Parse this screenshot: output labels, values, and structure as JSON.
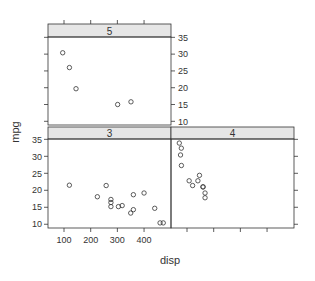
{
  "chart_data": {
    "type": "scatter",
    "title": "",
    "xlabel": "disp",
    "ylabel": "mpg",
    "conditioning_variable": "gear",
    "layout": "2 columns x 2 rows, panels 3 and 4 on bottom row, panel 5 top-left",
    "xlim": [
      40,
      501
    ],
    "ylim": [
      8.9,
      35.1
    ],
    "x_ticks": [
      100,
      200,
      300,
      400
    ],
    "y_ticks": [
      10,
      15,
      20,
      25,
      30,
      35
    ],
    "grid": false,
    "legend": null,
    "marker": "open-circle",
    "colors": {
      "strip_fill": "#e6e6e6",
      "axis": "#333333",
      "points": "#333333"
    },
    "panels": [
      {
        "strip_label": "3",
        "points": [
          {
            "x": 258,
            "y": 21.4
          },
          {
            "x": 360,
            "y": 18.7
          },
          {
            "x": 225,
            "y": 18.1
          },
          {
            "x": 360,
            "y": 14.3
          },
          {
            "x": 275.8,
            "y": 16.4
          },
          {
            "x": 275.8,
            "y": 17.3
          },
          {
            "x": 275.8,
            "y": 15.2
          },
          {
            "x": 472,
            "y": 10.4
          },
          {
            "x": 460,
            "y": 10.4
          },
          {
            "x": 440,
            "y": 14.7
          },
          {
            "x": 120.1,
            "y": 21.5
          },
          {
            "x": 318,
            "y": 15.5
          },
          {
            "x": 304,
            "y": 15.2
          },
          {
            "x": 350,
            "y": 13.3
          },
          {
            "x": 400,
            "y": 19.2
          }
        ]
      },
      {
        "strip_label": "4",
        "points": [
          {
            "x": 160,
            "y": 21.0
          },
          {
            "x": 160,
            "y": 21.0
          },
          {
            "x": 108,
            "y": 22.8
          },
          {
            "x": 146.7,
            "y": 24.4
          },
          {
            "x": 140.8,
            "y": 22.8
          },
          {
            "x": 167.6,
            "y": 19.2
          },
          {
            "x": 167.6,
            "y": 17.8
          },
          {
            "x": 78.7,
            "y": 32.4
          },
          {
            "x": 75.7,
            "y": 30.4
          },
          {
            "x": 71.1,
            "y": 33.9
          },
          {
            "x": 79,
            "y": 27.3
          },
          {
            "x": 121,
            "y": 21.4
          }
        ]
      },
      {
        "strip_label": "5",
        "points": [
          {
            "x": 120.3,
            "y": 26.0
          },
          {
            "x": 95.1,
            "y": 30.4
          },
          {
            "x": 351,
            "y": 15.8
          },
          {
            "x": 145,
            "y": 19.7
          },
          {
            "x": 301,
            "y": 15.0
          }
        ]
      }
    ]
  },
  "labels": {
    "xlabel": "disp",
    "ylabel": "mpg",
    "strip_3": "3",
    "strip_4": "4",
    "strip_5": "5"
  }
}
